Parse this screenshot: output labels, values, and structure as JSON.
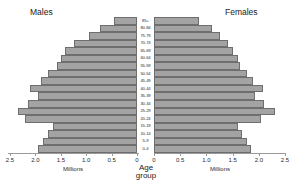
{
  "titles": {
    "males": "Males",
    "females": "Females",
    "age_group_line1": "Age",
    "age_group_line2": "group",
    "millions_left": "Millions",
    "millions_right": "Millions"
  },
  "colors": {
    "bar_fill": "#a3a3a3",
    "bar_stroke": "#6e6e6e",
    "axis": "#9a9a9a",
    "text": "#2a2a2a",
    "background": "#ffffff"
  },
  "chart_data": {
    "type": "bar",
    "subtype": "population-pyramid",
    "title": "",
    "xlabel": "Millions",
    "ylabel": "Age group",
    "grid": false,
    "legend_position": "none",
    "xlim_left": [
      2.5,
      0
    ],
    "xlim_right": [
      0,
      2.5
    ],
    "xticks_left": [
      "2.5",
      "2.0",
      "1.5",
      "1.0",
      "0.5",
      "0"
    ],
    "xticks_right": [
      "0",
      "0.5",
      "1.0",
      "1.5",
      "2.0",
      "2.5"
    ],
    "xtick_values": [
      0,
      0.5,
      1.0,
      1.5,
      2.0,
      2.5
    ],
    "categories": [
      "85+",
      "80-84",
      "75-79",
      "70-74",
      "65-69",
      "60-64",
      "55-59",
      "50-54",
      "45-49",
      "40-44",
      "35-39",
      "30-34",
      "25-29",
      "20-24",
      "15-19",
      "10-14",
      "5-9",
      "0-4"
    ],
    "series": [
      {
        "name": "Males",
        "side": "left",
        "unit": "millions",
        "values": [
          0.45,
          0.72,
          0.95,
          1.25,
          1.42,
          1.5,
          1.58,
          1.75,
          1.88,
          2.1,
          1.95,
          2.15,
          2.35,
          2.2,
          1.65,
          1.75,
          1.85,
          1.95
        ]
      },
      {
        "name": "Females",
        "side": "right",
        "unit": "millions",
        "values": [
          0.85,
          1.1,
          1.25,
          1.42,
          1.5,
          1.6,
          1.65,
          1.78,
          1.88,
          2.08,
          1.92,
          2.1,
          2.3,
          2.05,
          1.6,
          1.68,
          1.78,
          1.85
        ]
      }
    ]
  },
  "geometry": {
    "left_zero_px": 137,
    "left_max_px": 10,
    "right_zero_px": 154,
    "right_max_px": 285,
    "axis_max_value": 2.5
  }
}
